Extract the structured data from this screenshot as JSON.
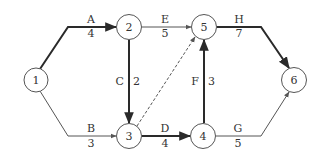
{
  "diagram": {
    "type": "activity-network",
    "colors": {
      "line": "#2a2a2a",
      "thin_line": "#555555",
      "node_stroke": "#555555",
      "text": "#333333",
      "background": "#ffffff"
    },
    "nodes": [
      {
        "id": "1",
        "label": "1",
        "cx": 36,
        "cy": 80
      },
      {
        "id": "2",
        "label": "2",
        "cx": 129,
        "cy": 27
      },
      {
        "id": "3",
        "label": "3",
        "cx": 129,
        "cy": 136
      },
      {
        "id": "4",
        "label": "4",
        "cx": 203,
        "cy": 136
      },
      {
        "id": "5",
        "label": "5",
        "cx": 204,
        "cy": 27
      },
      {
        "id": "6",
        "label": "6",
        "cx": 294,
        "cy": 80
      }
    ],
    "edges": [
      {
        "name": "A",
        "duration": "4",
        "from": "1",
        "to": "2",
        "critical": true,
        "dashed": false
      },
      {
        "name": "B",
        "duration": "3",
        "from": "1",
        "to": "3",
        "critical": false,
        "dashed": false
      },
      {
        "name": "C",
        "duration": "2",
        "from": "2",
        "to": "3",
        "critical": true,
        "dashed": false
      },
      {
        "name": "E",
        "duration": "5",
        "from": "2",
        "to": "5",
        "critical": false,
        "dashed": false
      },
      {
        "name": "D",
        "duration": "4",
        "from": "3",
        "to": "4",
        "critical": true,
        "dashed": false
      },
      {
        "name": "F",
        "duration": "3",
        "from": "4",
        "to": "5",
        "critical": true,
        "dashed": false
      },
      {
        "name": "H",
        "duration": "7",
        "from": "5",
        "to": "6",
        "critical": true,
        "dashed": false
      },
      {
        "name": "G",
        "duration": "5",
        "from": "4",
        "to": "6",
        "critical": false,
        "dashed": false
      },
      {
        "name": "dummy",
        "duration": "",
        "from": "3",
        "to": "5",
        "critical": false,
        "dashed": true
      }
    ]
  }
}
